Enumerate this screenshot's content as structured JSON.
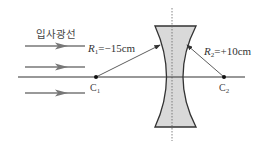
{
  "diagram": {
    "type": "concave-lens-radii",
    "incident_label": "입사광선",
    "r1": {
      "symbol": "R",
      "sub": "1",
      "value": "=−15cm"
    },
    "r2": {
      "symbol": "R",
      "sub": "2",
      "value": "=+10cm"
    },
    "c1": {
      "symbol": "C",
      "sub": "1"
    },
    "c2": {
      "symbol": "C",
      "sub": "2"
    },
    "incident_ray_count": 3,
    "colors": {
      "lens_fill": "#d9d9d9",
      "line": "#333333",
      "ray": "#777777"
    }
  }
}
